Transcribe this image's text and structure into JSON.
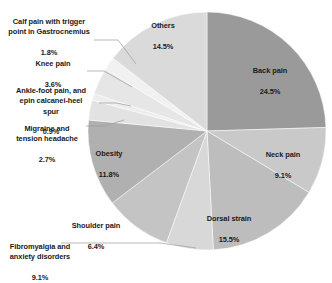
{
  "chart_data": {
    "type": "pie",
    "title": "",
    "subtitle": "",
    "xlabel": "",
    "ylabel": "",
    "legend_position": "none",
    "grid": false,
    "units": "percent",
    "start_angle_deg": 0,
    "direction": "clockwise",
    "categories": [
      "Back pain",
      "Neck pain",
      "Dorsal strain",
      "Shoulder pain",
      "Fibromyalgia and anxiety disorders",
      "Obesity",
      "Migraine and tension headache",
      "Ankle-foot pain, and epin calcanei-heel spur",
      "Knee pain",
      "Calf pain with trigger point in Gastrocnemius",
      "Others"
    ],
    "values": [
      24.5,
      9.1,
      15.5,
      6.4,
      9.1,
      11.8,
      2.7,
      0.9,
      3.6,
      1.8,
      14.5
    ],
    "value_labels": [
      "24.5%",
      "9.1%",
      "15.5%",
      "6.4%",
      "9.1%",
      "11.8%",
      "2.7%",
      "0.9%",
      "3.6%",
      "1.8%",
      "14.5%"
    ],
    "colors": [
      "#9a9a9a",
      "#c9c9c9",
      "#bdbdbd",
      "#d8d8d8",
      "#c4c4c4",
      "#b0b0b0",
      "#e2e2e2",
      "#ededed",
      "#e6e6e6",
      "#f1f1f1",
      "#dadada"
    ],
    "slices": [
      {
        "name": "Back pain",
        "value": 24.5,
        "label": "Back pain",
        "value_label": "24.5%",
        "color": "#9a9a9a",
        "label_placement": "inside"
      },
      {
        "name": "Neck pain",
        "value": 9.1,
        "label": "Neck pain",
        "value_label": "9.1%",
        "color": "#c9c9c9",
        "label_placement": "inside"
      },
      {
        "name": "Dorsal strain",
        "value": 15.5,
        "label": "Dorsal strain",
        "value_label": "15.5%",
        "color": "#bdbdbd",
        "label_placement": "inside"
      },
      {
        "name": "Shoulder pain",
        "value": 6.4,
        "label": "Shoulder pain",
        "value_label": "6.4%",
        "color": "#d8d8d8",
        "label_placement": "outside"
      },
      {
        "name": "Fibromyalgia and anxiety disorders",
        "value": 9.1,
        "label": "Fibromyalgia and\nanxiety disorders",
        "value_label": "9.1%",
        "color": "#c4c4c4",
        "label_placement": "outside"
      },
      {
        "name": "Obesity",
        "value": 11.8,
        "label": "Obesity",
        "value_label": "11.8%",
        "color": "#b0b0b0",
        "label_placement": "inside"
      },
      {
        "name": "Migraine and tension headache",
        "value": 2.7,
        "label": "Migraine and\ntension headache",
        "value_label": "2.7%",
        "color": "#e2e2e2",
        "label_placement": "outside"
      },
      {
        "name": "Ankle-foot pain, and epin calcanei-heel spur",
        "value": 0.9,
        "label": "Ankle-foot pain, and\nepin calcanei-heel\nspur",
        "value_label": "0.9%",
        "color": "#ededed",
        "label_placement": "outside"
      },
      {
        "name": "Knee pain",
        "value": 3.6,
        "label": "Knee pain",
        "value_label": "3.6%",
        "color": "#e6e6e6",
        "label_placement": "outside"
      },
      {
        "name": "Calf pain with trigger point in Gastrocnemius",
        "value": 1.8,
        "label": "Calf pain with trigger\npoint in Gastrocnemius",
        "value_label": "1.8%",
        "color": "#f1f1f1",
        "label_placement": "outside"
      },
      {
        "name": "Others",
        "value": 14.5,
        "label": "Others",
        "value_label": "14.5%",
        "color": "#dadada",
        "label_placement": "inside"
      }
    ]
  },
  "labels": {
    "back_pain": {
      "text": "Back pain",
      "value": "24.5%"
    },
    "neck_pain": {
      "text": "Neck pain",
      "value": "9.1%"
    },
    "dorsal_strain": {
      "text": "Dorsal strain",
      "value": "15.5%"
    },
    "shoulder_pain": {
      "text": "Shoulder pain",
      "value": "6.4%"
    },
    "fibromyalgia": {
      "text": "Fibromyalgia and\nanxiety disorders",
      "value": "9.1%"
    },
    "obesity": {
      "text": "Obesity",
      "value": "11.8%"
    },
    "migraine": {
      "text": "Migraine and\ntension headache",
      "value": "2.7%"
    },
    "ankle_foot": {
      "text": "Ankle-foot pain, and\nepin calcanei-heel\nspur",
      "value": "0.9%"
    },
    "knee_pain": {
      "text": "Knee pain",
      "value": "3.6%"
    },
    "calf_pain": {
      "text": "Calf pain with trigger\npoint in Gastrocnemius",
      "value": "1.8%"
    },
    "others": {
      "text": "Others",
      "value": "14.5%"
    }
  }
}
